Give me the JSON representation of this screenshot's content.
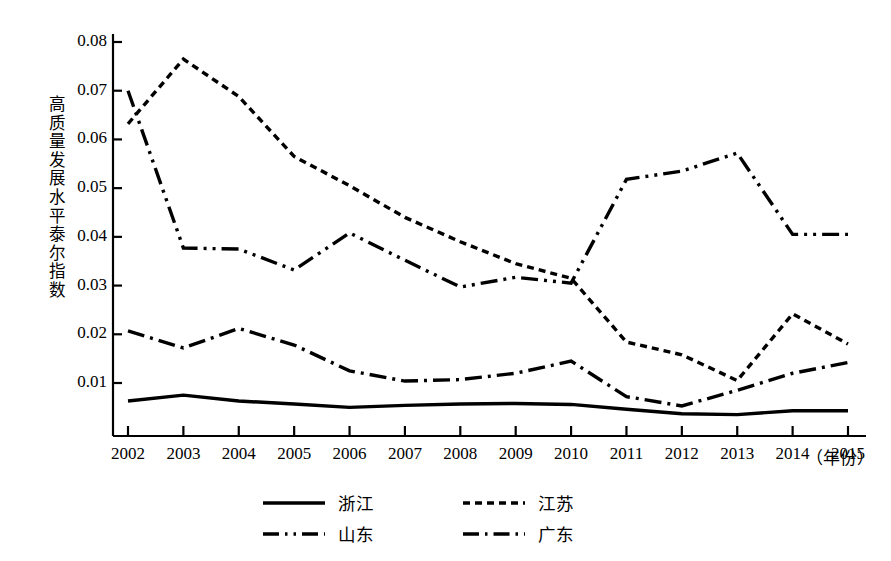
{
  "chart_data": {
    "type": "line",
    "title": "",
    "xlabel": "（年份）",
    "ylabel": "高质量发展水平泰尔指数",
    "x": [
      2002,
      2003,
      2004,
      2005,
      2006,
      2007,
      2008,
      2009,
      2010,
      2011,
      2012,
      2013,
      2014,
      2015
    ],
    "xticklabels": [
      "2002",
      "2003",
      "2004",
      "2005",
      "2006",
      "2007",
      "2008",
      "2009",
      "2010",
      "2011",
      "2012",
      "2013",
      "2014",
      "2015"
    ],
    "yticklabels": [
      "0.01",
      "0.02",
      "0.03",
      "0.04",
      "0.05",
      "0.06",
      "0.07",
      "0.08"
    ],
    "ytickvalues": [
      0.01,
      0.02,
      0.03,
      0.04,
      0.05,
      0.06,
      0.07,
      0.08
    ],
    "ylim": [
      0.0,
      0.082
    ],
    "xlim": [
      2002,
      2015
    ],
    "grid": false,
    "legend_position": "bottom",
    "series": [
      {
        "name": "浙江",
        "style": "solid",
        "values": [
          0.0063,
          0.0075,
          0.0063,
          0.0057,
          0.005,
          0.0054,
          0.0057,
          0.0058,
          0.0056,
          0.0046,
          0.0037,
          0.0035,
          0.0043,
          0.0043
        ]
      },
      {
        "name": "江苏",
        "style": "dotted",
        "values": [
          0.0632,
          0.0765,
          0.0688,
          0.0565,
          0.0505,
          0.044,
          0.039,
          0.0345,
          0.0315,
          0.0184,
          0.0158,
          0.0105,
          0.0242,
          0.018
        ]
      },
      {
        "name": "山东",
        "style": "dash-dot-dot",
        "values": [
          0.07,
          0.0377,
          0.0375,
          0.0332,
          0.0408,
          0.0352,
          0.0297,
          0.0317,
          0.0305,
          0.0518,
          0.0535,
          0.0572,
          0.0405,
          0.0405
        ]
      },
      {
        "name": "广东",
        "style": "dash-dot",
        "values": [
          0.0207,
          0.0172,
          0.0212,
          0.0178,
          0.0125,
          0.0104,
          0.0107,
          0.012,
          0.0145,
          0.0072,
          0.0053,
          0.0085,
          0.012,
          0.0142
        ]
      }
    ]
  },
  "legend": {
    "items": [
      {
        "label": "浙江",
        "style": "solid"
      },
      {
        "label": "江苏",
        "style": "dotted"
      },
      {
        "label": "山东",
        "style": "dash-dot-dot"
      },
      {
        "label": "广东",
        "style": "dash-dot"
      }
    ]
  },
  "axis": {
    "y_label_chars": [
      "高",
      "质",
      "量",
      "发",
      "展",
      "水",
      "平",
      "泰",
      "尔",
      "指",
      "数"
    ],
    "x_unit": "（年份）"
  },
  "colors": {
    "line": "#000000",
    "background": "#ffffff",
    "text": "#000000"
  }
}
